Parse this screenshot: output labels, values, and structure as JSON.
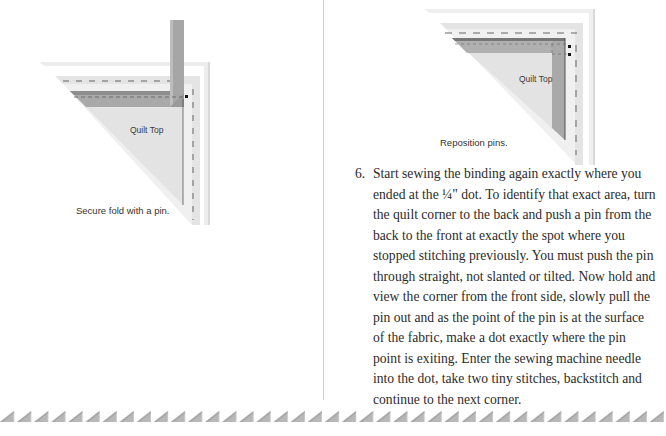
{
  "figures": [
    {
      "id": "secure-fold",
      "label": "Quilt Top",
      "caption": "Secure fold with a pin."
    },
    {
      "id": "reposition-pins",
      "label": "Quilt Top",
      "caption": "Reposition pins."
    }
  ],
  "step": {
    "number": "6.",
    "lines": [
      "Start sewing the binding again exactly where you",
      "ended at the ¼\" dot. To identify that exact area, turn",
      "the quilt corner to the back and push a pin from the",
      "back to the front at exactly the spot where you",
      "stopped stitching previously. You must push the pin",
      "through straight, not slanted or tilted. Now hold and",
      "view the corner from the front side, slowly pull the",
      "pin out and as the point of the pin is at the surface",
      "of the fabric, make a dot exactly where the pin",
      "point is exiting. Enter the sewing machine needle",
      "into the dot, take two tiny stitches, backstitch and",
      "continue to the next corner."
    ]
  },
  "decoration": {
    "border_pattern": "sawtooth-triangles",
    "triangle_color": "#b8b8b8",
    "divider_color": "#cfcfcf"
  }
}
